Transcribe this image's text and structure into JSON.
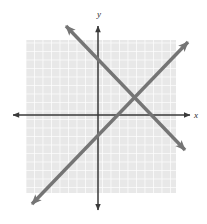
{
  "figure": {
    "width": 207,
    "height": 224,
    "background_color": "#ffffff"
  },
  "grid": {
    "name": "grid-square",
    "fill_color": "#e8e8e8",
    "line_color": "#fdfdfd",
    "left": 26,
    "top": 40,
    "right": 176,
    "bottom": 193,
    "cell_size": 8.5,
    "visible": true
  },
  "axes": {
    "color": "#3a3a3a",
    "x_axis": {
      "label": "x",
      "y_position": 115,
      "start_x": 13,
      "end_x": 190,
      "arrows": "both"
    },
    "y_axis": {
      "label": "y",
      "x_position": 98,
      "start_y": 26,
      "end_y": 210,
      "arrows": "both"
    },
    "origin": {
      "x": 98,
      "y": 115
    }
  },
  "chart_data": {
    "type": "line",
    "xlabel": "x",
    "ylabel": "y",
    "grid": true,
    "legend": "none",
    "xlim": [
      -8.5,
      10.8
    ],
    "ylim": [
      -11.2,
      10.5
    ],
    "series": [
      {
        "name": "descending-line",
        "color": "#757575",
        "arrows": "both",
        "slope": -1.04,
        "x": [
          -3.8,
          10.2
        ],
        "y": [
          10.5,
          -4.1
        ],
        "pixel_start": {
          "x": 66,
          "y": 26
        },
        "pixel_end": {
          "x": 185,
          "y": 150
        }
      },
      {
        "name": "ascending-line",
        "color": "#757575",
        "arrows": "both",
        "slope": 1.04,
        "x": [
          -7.8,
          10.6
        ],
        "y": [
          -10.5,
          8.6
        ],
        "pixel_start": {
          "x": 32,
          "y": 204
        },
        "pixel_end": {
          "x": 188,
          "y": 42
        }
      }
    ],
    "annotations": [
      {
        "name": "intersection-point",
        "pixel": {
          "x": 135,
          "y": 98
        },
        "x": 4.35,
        "y": 2.0,
        "labeled": false
      }
    ]
  }
}
